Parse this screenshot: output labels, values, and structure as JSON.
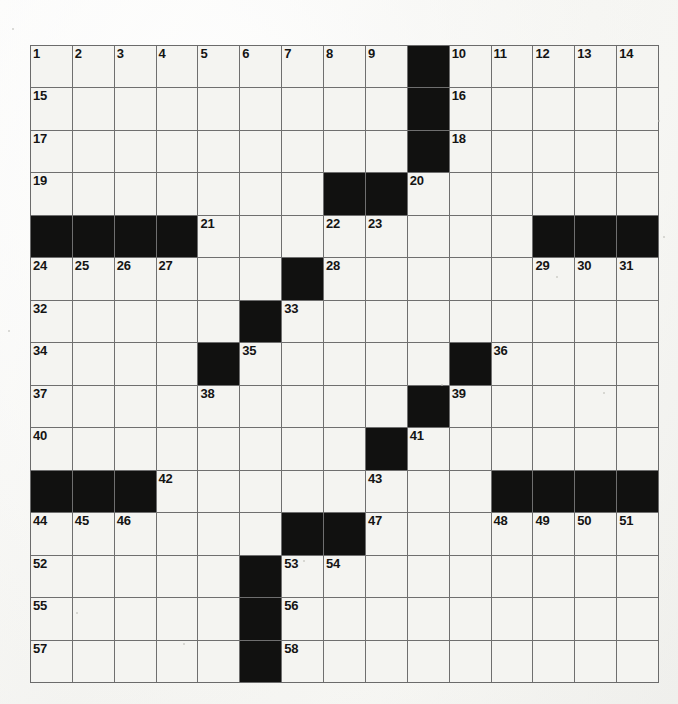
{
  "puzzle": {
    "type": "crossword-grid",
    "rows": 15,
    "columns": 15,
    "cell_background_color": "#f4f4f1",
    "block_color": "#111110",
    "grid_line_color": "#6f6f6f",
    "page_background_color": "#f7f7f5",
    "highest_clue_number": 58,
    "block_count": 29,
    "blocks": [
      [
        0,
        9
      ],
      [
        1,
        9
      ],
      [
        2,
        9
      ],
      [
        3,
        7
      ],
      [
        3,
        8
      ],
      [
        4,
        0
      ],
      [
        4,
        1
      ],
      [
        4,
        2
      ],
      [
        4,
        3
      ],
      [
        4,
        12
      ],
      [
        4,
        13
      ],
      [
        4,
        14
      ],
      [
        5,
        6
      ],
      [
        6,
        5
      ],
      [
        7,
        4
      ],
      [
        7,
        10
      ],
      [
        8,
        9
      ],
      [
        9,
        8
      ],
      [
        10,
        0
      ],
      [
        10,
        1
      ],
      [
        10,
        2
      ],
      [
        10,
        11
      ],
      [
        10,
        12
      ],
      [
        10,
        13
      ],
      [
        10,
        14
      ],
      [
        11,
        6
      ],
      [
        11,
        7
      ],
      [
        12,
        5
      ],
      [
        13,
        5
      ],
      [
        14,
        5
      ]
    ],
    "numbers": [
      {
        "row": 0,
        "col": 0,
        "n": "1"
      },
      {
        "row": 0,
        "col": 1,
        "n": "2"
      },
      {
        "row": 0,
        "col": 2,
        "n": "3"
      },
      {
        "row": 0,
        "col": 3,
        "n": "4"
      },
      {
        "row": 0,
        "col": 4,
        "n": "5"
      },
      {
        "row": 0,
        "col": 5,
        "n": "6"
      },
      {
        "row": 0,
        "col": 6,
        "n": "7"
      },
      {
        "row": 0,
        "col": 7,
        "n": "8"
      },
      {
        "row": 0,
        "col": 8,
        "n": "9"
      },
      {
        "row": 0,
        "col": 10,
        "n": "10"
      },
      {
        "row": 0,
        "col": 11,
        "n": "11"
      },
      {
        "row": 0,
        "col": 12,
        "n": "12"
      },
      {
        "row": 0,
        "col": 13,
        "n": "13"
      },
      {
        "row": 0,
        "col": 14,
        "n": "14"
      },
      {
        "row": 1,
        "col": 0,
        "n": "15"
      },
      {
        "row": 1,
        "col": 10,
        "n": "16"
      },
      {
        "row": 2,
        "col": 0,
        "n": "17"
      },
      {
        "row": 2,
        "col": 10,
        "n": "18"
      },
      {
        "row": 3,
        "col": 0,
        "n": "19"
      },
      {
        "row": 3,
        "col": 9,
        "n": "20"
      },
      {
        "row": 4,
        "col": 4,
        "n": "21"
      },
      {
        "row": 4,
        "col": 7,
        "n": "22"
      },
      {
        "row": 4,
        "col": 8,
        "n": "23"
      },
      {
        "row": 5,
        "col": 0,
        "n": "24"
      },
      {
        "row": 5,
        "col": 1,
        "n": "25"
      },
      {
        "row": 5,
        "col": 2,
        "n": "26"
      },
      {
        "row": 5,
        "col": 3,
        "n": "27"
      },
      {
        "row": 5,
        "col": 7,
        "n": "28"
      },
      {
        "row": 5,
        "col": 12,
        "n": "29"
      },
      {
        "row": 5,
        "col": 13,
        "n": "30"
      },
      {
        "row": 5,
        "col": 14,
        "n": "31"
      },
      {
        "row": 6,
        "col": 0,
        "n": "32"
      },
      {
        "row": 6,
        "col": 6,
        "n": "33"
      },
      {
        "row": 7,
        "col": 0,
        "n": "34"
      },
      {
        "row": 7,
        "col": 5,
        "n": "35"
      },
      {
        "row": 7,
        "col": 11,
        "n": "36"
      },
      {
        "row": 8,
        "col": 0,
        "n": "37"
      },
      {
        "row": 8,
        "col": 4,
        "n": "38"
      },
      {
        "row": 8,
        "col": 10,
        "n": "39"
      },
      {
        "row": 9,
        "col": 0,
        "n": "40"
      },
      {
        "row": 9,
        "col": 9,
        "n": "41"
      },
      {
        "row": 10,
        "col": 3,
        "n": "42"
      },
      {
        "row": 10,
        "col": 8,
        "n": "43"
      },
      {
        "row": 11,
        "col": 0,
        "n": "44"
      },
      {
        "row": 11,
        "col": 1,
        "n": "45"
      },
      {
        "row": 11,
        "col": 2,
        "n": "46"
      },
      {
        "row": 11,
        "col": 8,
        "n": "47"
      },
      {
        "row": 11,
        "col": 11,
        "n": "48"
      },
      {
        "row": 11,
        "col": 12,
        "n": "49"
      },
      {
        "row": 11,
        "col": 13,
        "n": "50"
      },
      {
        "row": 11,
        "col": 14,
        "n": "51"
      },
      {
        "row": 12,
        "col": 0,
        "n": "52"
      },
      {
        "row": 12,
        "col": 6,
        "n": "53"
      },
      {
        "row": 12,
        "col": 7,
        "n": "54"
      },
      {
        "row": 13,
        "col": 0,
        "n": "55"
      },
      {
        "row": 13,
        "col": 6,
        "n": "56"
      },
      {
        "row": 14,
        "col": 0,
        "n": "57"
      },
      {
        "row": 14,
        "col": 6,
        "n": "58"
      }
    ],
    "entries": []
  },
  "specks": [
    {
      "x": 12,
      "y": 28,
      "d": 2
    },
    {
      "x": 556,
      "y": 276,
      "d": 2
    },
    {
      "x": 663,
      "y": 236,
      "d": 2
    },
    {
      "x": 603,
      "y": 392,
      "d": 2
    },
    {
      "x": 441,
      "y": 384,
      "d": 2
    },
    {
      "x": 183,
      "y": 643,
      "d": 2
    },
    {
      "x": 76,
      "y": 612,
      "d": 2
    },
    {
      "x": 303,
      "y": 560,
      "d": 2
    },
    {
      "x": 658,
      "y": 120,
      "d": 2
    },
    {
      "x": 8,
      "y": 330,
      "d": 2
    }
  ]
}
